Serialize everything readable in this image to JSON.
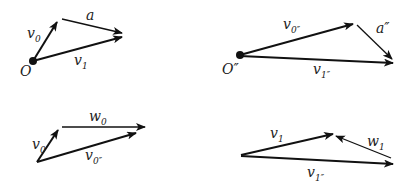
{
  "diagrams": [
    {
      "id": "top-left",
      "origin_label": "O",
      "vectors": [
        {
          "name": "v",
          "sub": "0",
          "prime": ""
        },
        {
          "name": "a",
          "sub": "",
          "prime": ""
        },
        {
          "name": "v",
          "sub": "1",
          "prime": ""
        }
      ]
    },
    {
      "id": "top-right",
      "origin_label": "O″",
      "vectors": [
        {
          "name": "v",
          "sub": "0″",
          "prime": ""
        },
        {
          "name": "a″",
          "sub": "",
          "prime": ""
        },
        {
          "name": "v",
          "sub": "1″",
          "prime": ""
        }
      ]
    },
    {
      "id": "bottom-left",
      "vectors": [
        {
          "name": "v",
          "sub": "0",
          "prime": ""
        },
        {
          "name": "w",
          "sub": "0",
          "prime": ""
        },
        {
          "name": "v",
          "sub": "0″",
          "prime": ""
        }
      ]
    },
    {
      "id": "bottom-right",
      "vectors": [
        {
          "name": "v",
          "sub": "1",
          "prime": ""
        },
        {
          "name": "w",
          "sub": "1",
          "prime": ""
        },
        {
          "name": "v",
          "sub": "1″",
          "prime": ""
        }
      ]
    }
  ],
  "colors": {
    "stroke": "#111111",
    "text": "#222222"
  }
}
